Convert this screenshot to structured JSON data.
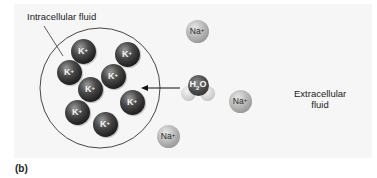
{
  "figure": {
    "panel_label": "(b)",
    "labels": {
      "intracellular": "Intracellular fluid",
      "extracellular_line1": "Extracellular",
      "extracellular_line2": "fluid"
    },
    "potassium_ions": [
      {
        "symbol": "K",
        "charge": "+",
        "x": 83,
        "y": 51
      },
      {
        "symbol": "K",
        "charge": "+",
        "x": 127,
        "y": 54
      },
      {
        "symbol": "K",
        "charge": "+",
        "x": 69,
        "y": 72
      },
      {
        "symbol": "K",
        "charge": "+",
        "x": 113,
        "y": 76
      },
      {
        "symbol": "K",
        "charge": "+",
        "x": 90,
        "y": 89
      },
      {
        "symbol": "K",
        "charge": "+",
        "x": 132,
        "y": 102
      },
      {
        "symbol": "K",
        "charge": "+",
        "x": 77,
        "y": 112
      },
      {
        "symbol": "K",
        "charge": "+",
        "x": 105,
        "y": 124
      }
    ],
    "sodium_ions": [
      {
        "symbol": "Na",
        "charge": "+",
        "x": 197,
        "y": 31
      },
      {
        "symbol": "Na",
        "charge": "+",
        "x": 240,
        "y": 101
      },
      {
        "symbol": "Na",
        "charge": "+",
        "x": 168,
        "y": 136
      }
    ],
    "water": {
      "symbol": "H",
      "subscript": "2",
      "symbol2": "O"
    },
    "arrow": {
      "direction": "into-cell"
    },
    "colors": {
      "panel_background": "#f6f6f6",
      "membrane": "#333333",
      "potassium": "#1c1c1c",
      "sodium": "#a8a8a8"
    }
  }
}
